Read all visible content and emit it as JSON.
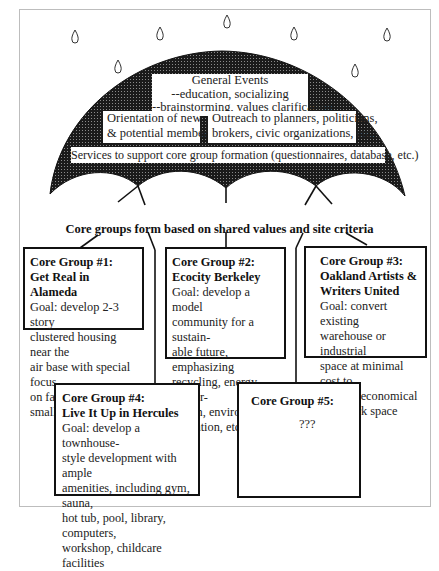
{
  "umbrella": {
    "general_events": {
      "title": "General Events",
      "line1": "--education, socializing",
      "line2": "--brainstorming, values clarification"
    },
    "orientation": {
      "line1": "Orientation of new",
      "line2": "& potential members"
    },
    "outreach": {
      "line1": "Outreach to planners, politicians,",
      "line2": "brokers, civic organizations, etc."
    },
    "services": "Services to support core group formation (questionnaires, database, etc.)"
  },
  "core_groups_heading": "Core groups form based on shared values and site criteria",
  "groups": [
    {
      "title1": "Core Group #1:",
      "title2": "Get Real in Alameda",
      "goal": [
        "Goal: develop 2-3 story",
        "clustered housing near the",
        "air base with special focus",
        "on families with small kids"
      ]
    },
    {
      "title1": "Core Group #2:",
      "title2": "Ecocity Berkeley",
      "goal": [
        "Goal: develop a model",
        "community for a sustain-",
        "able future, emphasizing",
        "recycling, energy conser-",
        "vation, environmental",
        "education, etc."
      ]
    },
    {
      "title1": "Core Group #3:",
      "title2": "Oakland Artists &",
      "title3": "Writers United",
      "goal": [
        "Goal: convert existing",
        "warehouse or industrial",
        "space at minimal cost to",
        "provide economical",
        "live/work space"
      ]
    },
    {
      "title1": "Core Group #4:",
      "title2": "Live It Up in Hercules",
      "goal": [
        "Goal: develop a townhouse-",
        "style development with ample",
        "amenities, including gym, sauna,",
        "hot tub, pool, library, computers,",
        "workshop, childcare facilities"
      ]
    },
    {
      "title1": "Core Group #5:",
      "placeholder": "???"
    }
  ],
  "icons": {
    "raindrop": "raindrop-icon",
    "umbrella": "umbrella-icon"
  }
}
